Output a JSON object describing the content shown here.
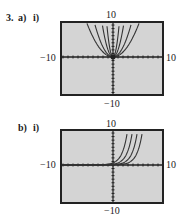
{
  "problem": {
    "number": "3.",
    "part_a": "a)",
    "part_a_sub": "i)",
    "part_b": "b)",
    "part_b_sub": "i)"
  },
  "colors": {
    "screen_bg": "#d4d4d4",
    "frame": "#222222",
    "curve": "#333333"
  },
  "chart_data": [
    {
      "type": "line",
      "title": "3. a) i)",
      "xlabel": "",
      "ylabel": "",
      "xlim": [
        -10,
        10
      ],
      "ylim": [
        -10,
        10
      ],
      "tick_labels": {
        "top": "10",
        "bottom": "-10",
        "left": "-10",
        "right": "10"
      },
      "grid": false,
      "series": [
        {
          "name": "y = x^4 (narrowest)",
          "shape": "even-power parabola-like",
          "k": 6
        },
        {
          "name": "y = x^2 (steep)",
          "shape": "parabola",
          "k": 2
        },
        {
          "name": "y = x^2 (wider)",
          "shape": "parabola",
          "k": 0.7
        },
        {
          "name": "y = x^2 (widest)",
          "shape": "parabola",
          "k": 0.35
        }
      ]
    },
    {
      "type": "line",
      "title": "b) i)",
      "xlabel": "",
      "ylabel": "",
      "xlim": [
        -10,
        10
      ],
      "ylim": [
        -10,
        10
      ],
      "tick_labels": {
        "top": "10",
        "bottom": "-10",
        "left": "-10",
        "right": "10"
      },
      "grid": false,
      "series": [
        {
          "name": "exponential shift 0",
          "shape": "exponential",
          "shift": 0
        },
        {
          "name": "exponential shift 1",
          "shape": "exponential",
          "shift": 1
        },
        {
          "name": "exponential shift 2",
          "shape": "exponential",
          "shift": 2
        },
        {
          "name": "exponential shift 3",
          "shape": "exponential",
          "shift": 3
        }
      ]
    }
  ]
}
